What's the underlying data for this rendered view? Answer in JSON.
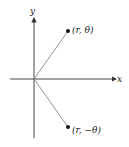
{
  "diagram": {
    "axes": {
      "x_label": "x",
      "y_label": "y"
    },
    "points": [
      {
        "label": "(r, θ)"
      },
      {
        "label": "(r, −θ)"
      }
    ],
    "colors": {
      "axis": "#333333",
      "ray": "#888888",
      "point": "#111111"
    }
  }
}
